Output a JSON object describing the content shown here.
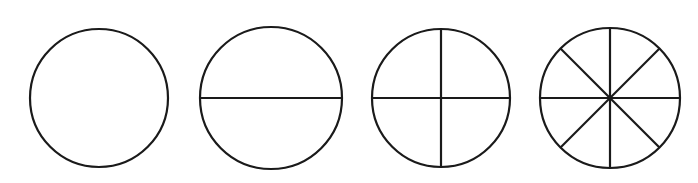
{
  "figure": {
    "name": "fraction-circles",
    "type": "diagram",
    "background_color": "#ffffff",
    "stroke_color": "#1a1a1a",
    "stroke_width": 2.2,
    "canvas": {
      "width": 698,
      "height": 183
    }
  },
  "circles": [
    {
      "id": "circle-whole",
      "label": "whole",
      "parts": 1,
      "fraction": "1/1",
      "center": {
        "x": 99,
        "y": 98
      },
      "radius": 69,
      "diameter_angles_deg": []
    },
    {
      "id": "circle-halves",
      "label": "halves",
      "parts": 2,
      "fraction": "1/2",
      "center": {
        "x": 271,
        "y": 98
      },
      "radius": 71,
      "diameter_angles_deg": [
        0
      ]
    },
    {
      "id": "circle-quarters",
      "label": "quarters",
      "parts": 4,
      "fraction": "1/4",
      "center": {
        "x": 441,
        "y": 98
      },
      "radius": 69,
      "diameter_angles_deg": [
        0,
        90
      ]
    },
    {
      "id": "circle-eighths",
      "label": "eighths",
      "parts": 8,
      "fraction": "1/8",
      "center": {
        "x": 610,
        "y": 98
      },
      "radius": 70,
      "diameter_angles_deg": [
        0,
        45,
        90,
        135
      ]
    }
  ]
}
